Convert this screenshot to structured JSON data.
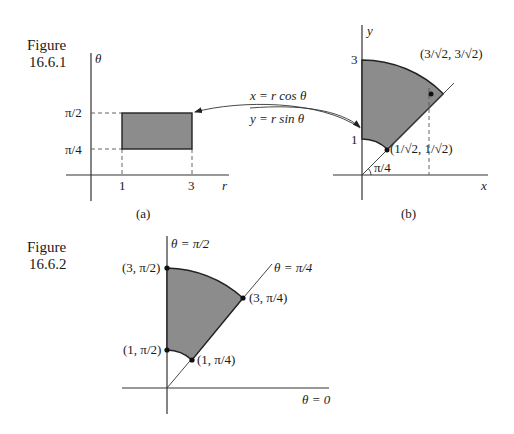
{
  "colors": {
    "region_fill": "#8c8c8c",
    "ink": "#1a1a1a"
  },
  "figure1": {
    "caption_line1": "Figure",
    "caption_line2": "16.6.1",
    "panel_a": {
      "sublabel": "(a)",
      "vertical_axis_label": "θ",
      "horizontal_axis_label": "r",
      "theta_ticks": [
        "π/2",
        "π/4"
      ],
      "r_ticks": [
        "1",
        "3"
      ],
      "region": {
        "r_min": 1,
        "r_max": 3,
        "theta_min": "π/4",
        "theta_max": "π/2"
      }
    },
    "transform": {
      "line1": "x = r cos θ",
      "line2": "y = r sin θ"
    },
    "panel_b": {
      "sublabel": "(b)",
      "x_axis_label": "x",
      "y_axis_label": "y",
      "y_ticks": [
        "3",
        "1"
      ],
      "angle_label": "π/4",
      "point_outer": "(3/√2, 3/√2)",
      "point_inner": "(1/√2, 1/√2)"
    }
  },
  "figure2": {
    "caption_line1": "Figure",
    "caption_line2": "16.6.2",
    "ray_vertical": "θ = π/2",
    "ray_diagonal": "θ = π/4",
    "ray_horizontal": "θ = 0",
    "points": [
      "(3, π/2)",
      "(3, π/4)",
      "(1, π/2)",
      "(1, π/4)"
    ]
  }
}
